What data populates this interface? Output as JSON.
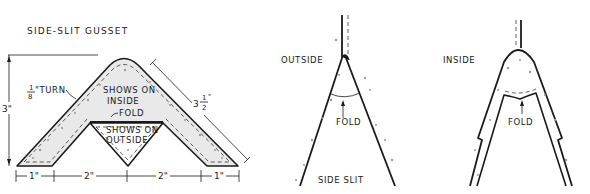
{
  "figure": {
    "left": {
      "title": "SIDE-SLIT GUSSET",
      "labels": {
        "turn_fraction_num": "1",
        "turn_fraction_den": "8",
        "turn_suffix": "\"TURN",
        "shows_on_inside_line1": "SHOWS ON",
        "shows_on_inside_line2": "INSIDE",
        "fold": "FOLD",
        "shows_on_outside_line1": "SHOWS ON",
        "shows_on_outside_line2": "OUTSIDE"
      },
      "dimensions": {
        "height": "3\"",
        "side_whole": "3",
        "side_frac_num": "1",
        "side_frac_den": "2",
        "side_suffix": "\"",
        "bottom": [
          "1\"",
          "2\"",
          "2\"",
          "1\""
        ]
      }
    },
    "middle": {
      "label_side": "OUTSIDE",
      "label_fold": "FOLD",
      "label_bottom": "SIDE SLIT"
    },
    "right": {
      "label_side": "INSIDE",
      "label_fold": "FOLD"
    }
  },
  "colors": {
    "ink": "#1a1a1a",
    "paper": "#ffffff",
    "stipple": "#9a9a9a"
  }
}
